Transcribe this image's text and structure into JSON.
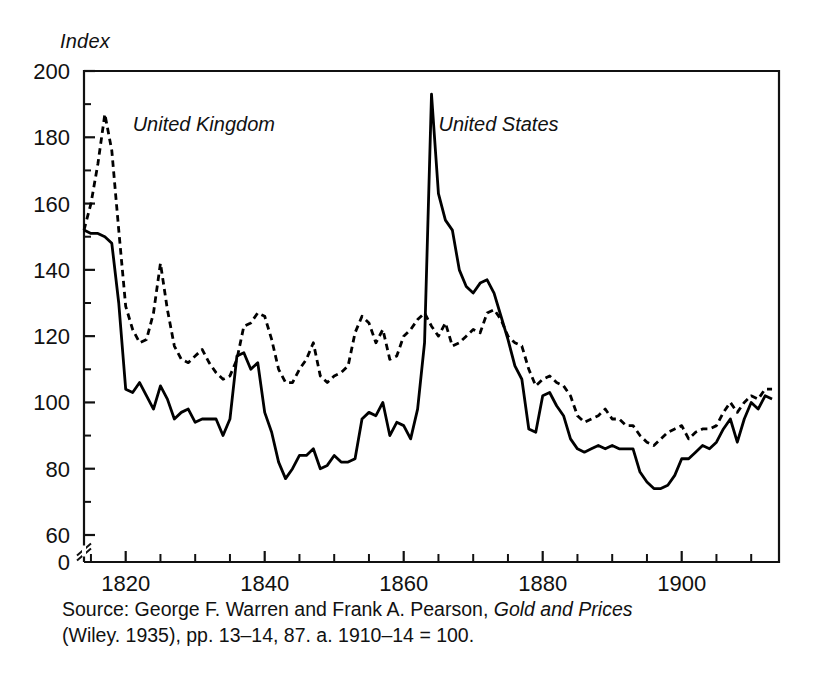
{
  "figure": {
    "y_axis_title": "Index",
    "source_line_1_pre": "Source: George F. Warren and Frank A. Pearson, ",
    "source_line_1_italic": "Gold and Prices",
    "source_line_2": "(Wiley. 1935), pp. 13–14, 87. a. 1910–14 = 100."
  },
  "chart_data": {
    "type": "line",
    "title": "",
    "xlabel": "",
    "ylabel": "Index",
    "xlim": [
      1814,
      1914
    ],
    "ylim": [
      60,
      200
    ],
    "ytick_labels": [
      "0",
      "60",
      "80",
      "100",
      "120",
      "140",
      "160",
      "180",
      "200"
    ],
    "yticks_major": [
      60,
      80,
      100,
      120,
      140,
      160,
      180,
      200
    ],
    "yticks_minor": [
      70,
      90,
      110,
      130,
      150,
      170,
      190
    ],
    "xticks_major": [
      1820,
      1840,
      1860,
      1880,
      1900
    ],
    "xtick_labels": [
      "1820",
      "1840",
      "1860",
      "1880",
      "1900"
    ],
    "xticks_minor": [
      1815,
      1825,
      1830,
      1835,
      1845,
      1850,
      1855,
      1865,
      1870,
      1875,
      1885,
      1890,
      1895,
      1905,
      1910
    ],
    "grid": false,
    "legend": "inline-annotations",
    "y_axis_break": true,
    "y_axis_break_at": 60,
    "annotations": [
      {
        "text": "United Kingdom",
        "x": 1821,
        "y": 182,
        "style": "italic"
      },
      {
        "text": "United States",
        "x": 1865,
        "y": 182,
        "style": "italic"
      }
    ],
    "series": [
      {
        "name": "United States",
        "style": "solid",
        "color": "#000000",
        "x": [
          1814,
          1815,
          1816,
          1817,
          1818,
          1819,
          1820,
          1821,
          1822,
          1823,
          1824,
          1825,
          1826,
          1827,
          1828,
          1829,
          1830,
          1831,
          1832,
          1833,
          1834,
          1835,
          1836,
          1837,
          1838,
          1839,
          1840,
          1841,
          1842,
          1843,
          1844,
          1845,
          1846,
          1847,
          1848,
          1849,
          1850,
          1851,
          1852,
          1853,
          1854,
          1855,
          1856,
          1857,
          1858,
          1859,
          1860,
          1861,
          1862,
          1863,
          1864,
          1865,
          1866,
          1867,
          1868,
          1869,
          1870,
          1871,
          1872,
          1873,
          1874,
          1875,
          1876,
          1877,
          1878,
          1879,
          1880,
          1881,
          1882,
          1883,
          1884,
          1885,
          1886,
          1887,
          1888,
          1889,
          1890,
          1891,
          1892,
          1893,
          1894,
          1895,
          1896,
          1897,
          1898,
          1899,
          1900,
          1901,
          1902,
          1903,
          1904,
          1905,
          1906,
          1907,
          1908,
          1909,
          1910,
          1911,
          1912,
          1913
        ],
        "values": [
          152,
          151,
          151,
          150,
          148,
          130,
          104,
          103,
          106,
          102,
          98,
          105,
          101,
          95,
          97,
          98,
          94,
          95,
          95,
          95,
          90,
          95,
          114,
          115,
          110,
          112,
          97,
          91,
          82,
          77,
          80,
          84,
          84,
          86,
          80,
          81,
          84,
          82,
          82,
          83,
          95,
          97,
          96,
          100,
          90,
          94,
          93,
          89,
          98,
          118,
          193,
          163,
          155,
          152,
          140,
          135,
          133,
          136,
          137,
          133,
          126,
          119,
          111,
          107,
          92,
          91,
          102,
          103,
          99,
          96,
          89,
          86,
          85,
          86,
          87,
          86,
          87,
          86,
          86,
          86,
          79,
          76,
          74,
          74,
          75,
          78,
          83,
          83,
          85,
          87,
          86,
          88,
          92,
          95,
          88,
          95,
          100,
          98,
          102,
          101
        ]
      },
      {
        "name": "United Kingdom",
        "style": "dashed",
        "color": "#000000",
        "x": [
          1814,
          1815,
          1816,
          1817,
          1818,
          1819,
          1820,
          1821,
          1822,
          1823,
          1824,
          1825,
          1826,
          1827,
          1828,
          1829,
          1830,
          1831,
          1832,
          1833,
          1834,
          1835,
          1836,
          1837,
          1838,
          1839,
          1840,
          1841,
          1842,
          1843,
          1844,
          1845,
          1846,
          1847,
          1848,
          1849,
          1850,
          1851,
          1852,
          1853,
          1854,
          1855,
          1856,
          1857,
          1858,
          1859,
          1860,
          1861,
          1862,
          1863,
          1864,
          1865,
          1866,
          1867,
          1868,
          1869,
          1870,
          1871,
          1872,
          1873,
          1874,
          1875,
          1876,
          1877,
          1878,
          1879,
          1880,
          1881,
          1882,
          1883,
          1884,
          1885,
          1886,
          1887,
          1888,
          1889,
          1890,
          1891,
          1892,
          1893,
          1894,
          1895,
          1896,
          1897,
          1898,
          1899,
          1900,
          1901,
          1902,
          1903,
          1904,
          1905,
          1906,
          1907,
          1908,
          1909,
          1910,
          1911,
          1912,
          1913
        ],
        "values": [
          152,
          160,
          172,
          187,
          176,
          152,
          129,
          122,
          118,
          119,
          127,
          142,
          128,
          117,
          113,
          112,
          114,
          116,
          112,
          109,
          107,
          108,
          113,
          123,
          124,
          127,
          126,
          119,
          110,
          106,
          106,
          110,
          113,
          118,
          108,
          106,
          108,
          109,
          111,
          121,
          126,
          124,
          118,
          122,
          113,
          114,
          120,
          122,
          125,
          127,
          123,
          120,
          124,
          117,
          118,
          120,
          122,
          121,
          127,
          128,
          125,
          120,
          118,
          117,
          110,
          105,
          107,
          108,
          106,
          105,
          102,
          96,
          94,
          95,
          96,
          98,
          95,
          95,
          93,
          93,
          90,
          88,
          87,
          89,
          91,
          92,
          93,
          89,
          91,
          92,
          92,
          93,
          97,
          100,
          97,
          100,
          102,
          101,
          104,
          104
        ]
      }
    ]
  }
}
